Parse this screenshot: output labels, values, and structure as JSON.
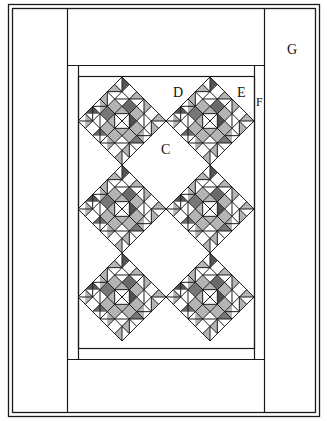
{
  "diagram": {
    "type": "quilt-layout",
    "labels": {
      "C": "C",
      "D": "D",
      "E": "E",
      "F": "F",
      "G": "G"
    },
    "layout": {
      "block_rows": 3,
      "block_cols": 2,
      "block_setting": "on-point",
      "block_grid": 6
    },
    "colors": {
      "line": "#1a1a1a",
      "shade": "#9a9a9a",
      "background": "#ffffff"
    }
  }
}
